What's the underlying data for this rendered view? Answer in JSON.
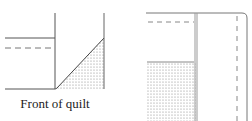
{
  "figure": {
    "left_panel": {
      "caption": "Front of quilt"
    },
    "right_panel": {
      "caption": ""
    },
    "colors": {
      "line": "#555555",
      "dash": "#888888",
      "shade": "#999999"
    }
  }
}
